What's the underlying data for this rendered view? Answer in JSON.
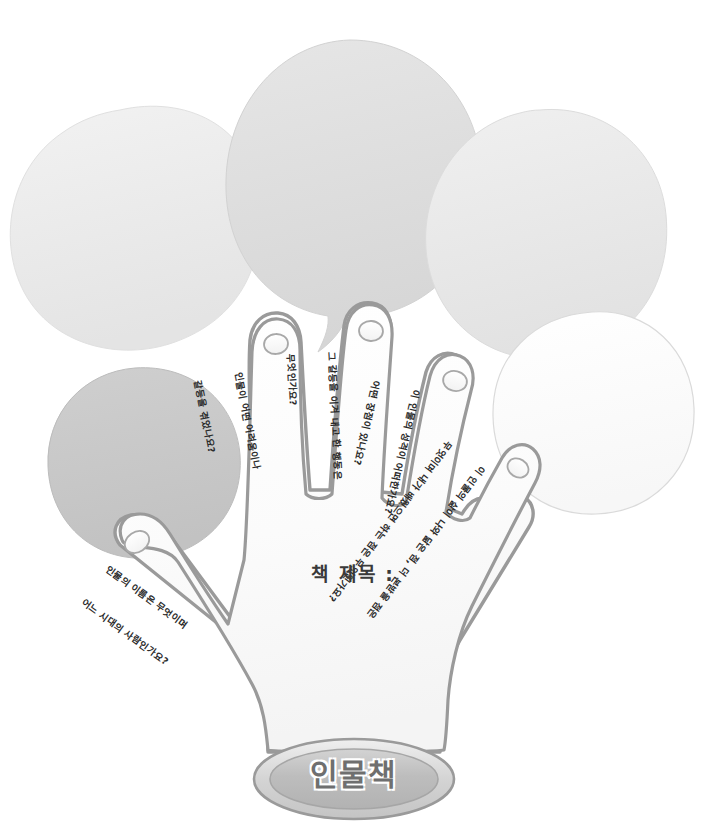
{
  "page": {
    "title": "인물책",
    "kind": "worksheet-hand-template",
    "background_color": "#ffffff"
  },
  "palette": {
    "balloon_light": "#eeeeee",
    "balloon_mid": "#e3e3e3",
    "balloon_dark": "#c9c9c9",
    "balloon_white": "#fcfcfc",
    "hand_fill": "#fbfbfb",
    "hand_outline": "#9a9a9a",
    "badge_fill": "#bdbdbd",
    "badge_rim": "#d8d8d8",
    "badge_outline": "#9a9a9a",
    "text_color": "#2b2b2b",
    "badge_text_color": "#6f6f6f"
  },
  "balloons": [
    {
      "name": "balloon-top-left",
      "tone": "#ececec",
      "label": "말풍선 왼쪽 위"
    },
    {
      "name": "balloon-top-center",
      "tone": "#dedede",
      "label": "말풍선 가운데 위"
    },
    {
      "name": "balloon-top-right",
      "tone": "#ebebeb",
      "label": "말풍선 오른쪽 위"
    },
    {
      "name": "balloon-mid-left",
      "tone": "#c9c9c9",
      "label": "말풍선 왼쪽 아래"
    },
    {
      "name": "balloon-mid-right",
      "tone": "#fcfcfc",
      "label": "말풍선 오른쪽 아래"
    }
  ],
  "hand": {
    "center_label": "책 제목 :",
    "fingers": [
      {
        "id": "thumb",
        "name": "손가락-엄지",
        "question_lines": [
          "인물의 이름은 무엇이며",
          "어느 시대의 사람인가요?"
        ],
        "question": "인물의 이름은 무엇이며 어느 시대의 사람인가요?"
      },
      {
        "id": "index",
        "name": "손가락-검지",
        "question_lines": [
          "인물이 어떤 어려움이나",
          "갈등을 겪었나요?"
        ],
        "question": "인물이 어떤 어려움이나 갈등을 겪었나요?"
      },
      {
        "id": "middle",
        "name": "손가락-중지",
        "question_lines": [
          "그 갈등을 이겨 내고 한 행동은",
          "무엇인가요?"
        ],
        "question": "그 갈등을 이겨 내고 한 행동은 무엇인가요?"
      },
      {
        "id": "ring",
        "name": "손가락-약지",
        "question_lines": [
          "이 인물의 성격이 어떠한가요?",
          "어떤 장점이 있나요?"
        ],
        "question": "이 인물의 성격이 어떠한가요? 어떤 장점이 있나요?"
      },
      {
        "id": "pinky",
        "name": "손가락-새끼",
        "question_lines": [
          "이 인물의 삶이 나와 닮은 점, 더 본받을 점은",
          "무엇이며 내가 배웠으면 하는 점은 무엇인가요?"
        ],
        "question": "이 인물의 삶이 나와 닮은 점, 더 본받을 점은 무엇이며 내가 배웠으면 하는 점은 무엇인가요?"
      }
    ]
  },
  "badge": {
    "text": "인물책"
  }
}
